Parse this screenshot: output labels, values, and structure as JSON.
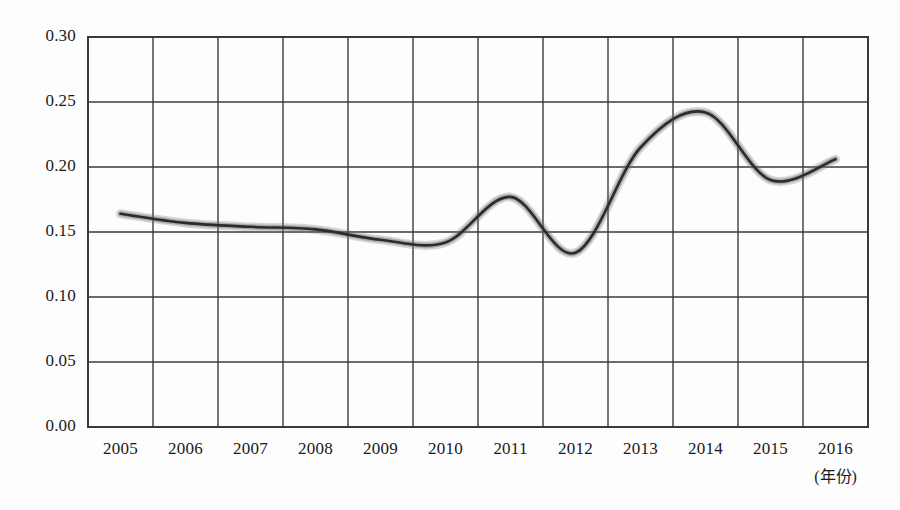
{
  "chart_data": {
    "type": "line",
    "title": "",
    "subtitle": "",
    "xlabel": "(年份)",
    "ylabel": "",
    "x": [
      2005,
      2006,
      2007,
      2008,
      2009,
      2010,
      2011,
      2012,
      2013,
      2014,
      2015,
      2016
    ],
    "categories": [
      "2005",
      "2006",
      "2007",
      "2008",
      "2009",
      "2010",
      "2011",
      "2012",
      "2013",
      "2014",
      "2015",
      "2016"
    ],
    "values": [
      0.164,
      0.157,
      0.154,
      0.152,
      0.144,
      0.142,
      0.177,
      0.134,
      0.215,
      0.242,
      0.19,
      0.206
    ],
    "series": [
      {
        "name": "",
        "values": [
          0.164,
          0.157,
          0.154,
          0.152,
          0.144,
          0.142,
          0.177,
          0.134,
          0.215,
          0.242,
          0.19,
          0.206
        ]
      }
    ],
    "ylim": [
      0.0,
      0.3
    ],
    "ytick_labels": [
      "0.00",
      "0.05",
      "0.10",
      "0.15",
      "0.20",
      "0.25",
      "0.30"
    ],
    "ytick_values": [
      0.0,
      0.05,
      0.1,
      0.15,
      0.2,
      0.25,
      0.3
    ],
    "xtick_labels": [
      "2005",
      "2006",
      "2007",
      "2008",
      "2009",
      "2010",
      "2011",
      "2012",
      "2013",
      "2014",
      "2015",
      "2016"
    ],
    "grid": true,
    "grid_x": true,
    "grid_y": true,
    "legend": false,
    "legend_position": "none",
    "annotations": [],
    "line_color": "#2b2b2b",
    "grid_color": "#3a3a3a",
    "background_color": "#fdfdfd",
    "smooth": true,
    "markers": false
  },
  "axes": {
    "y_axis_name": "y-axis",
    "x_axis_name": "x-axis",
    "x_unit_label": "(年份)"
  }
}
